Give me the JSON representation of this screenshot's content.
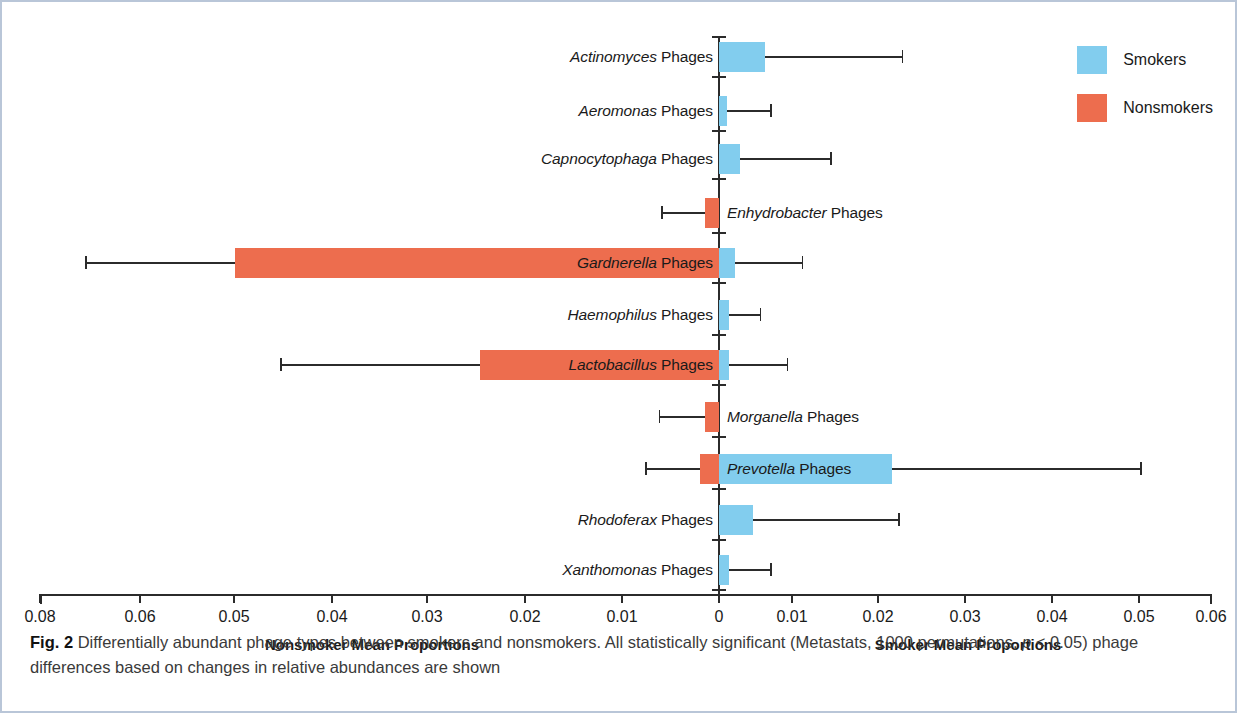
{
  "figure": {
    "caption_label": "Fig. 2",
    "caption_text_part1": "Differentially abundant phage types between smokers and nonsmokers. All statistically significant (Metastats, 1000 permutations, ",
    "caption_p_italic": "p",
    "caption_text_part2": " < 0.05) phage differences based on changes in relative abundances are shown"
  },
  "legend": {
    "position": "top-right",
    "items": [
      {
        "label": "Smokers",
        "color": "#82cdee"
      },
      {
        "label": "Nonsmokers",
        "color": "#ed6d4e"
      }
    ]
  },
  "axis": {
    "left_caption": "Nonsmoker Mean Proportions",
    "right_caption": "Smoker Mean Proportions",
    "tick_labels": [
      "0.08",
      "0.06",
      "0.05",
      "0.04",
      "0.03",
      "0.02",
      "0.01",
      "0",
      "0.01",
      "0.02",
      "0.03",
      "0.04",
      "0.05",
      "0.06"
    ],
    "tick_x": [
      38,
      138,
      232,
      330,
      425,
      523,
      620,
      717,
      790,
      876,
      963,
      1050,
      1137,
      1209
    ]
  },
  "chart_data": {
    "type": "bar",
    "orientation": "horizontal",
    "subtype": "diverging-paired-bar-with-error-bars",
    "title": "Differentially abundant phage types between smokers and nonsmokers",
    "xlabel_left": "Nonsmoker Mean Proportions",
    "xlabel_right": "Smoker Mean Proportions",
    "ylabel": "",
    "grid": false,
    "legend_position": "top-right",
    "xlim_left": 0.08,
    "xlim_right": 0.06,
    "xticks_left": [
      0.08,
      0.06,
      0.05,
      0.04,
      0.03,
      0.02,
      0.01,
      0
    ],
    "xticks_right": [
      0,
      0.01,
      0.02,
      0.03,
      0.04,
      0.05,
      0.06
    ],
    "series": [
      {
        "name": "Smokers",
        "color": "#82cdee",
        "side": "right"
      },
      {
        "name": "Nonsmokers",
        "color": "#ed6d4e",
        "side": "left"
      }
    ],
    "categories": [
      "Actinomyces Phages",
      "Aeromonas Phages",
      "Capnocytophaga Phages",
      "Enhydrobacter Phages",
      "Gardnerella Phages",
      "Haemophilus Phages",
      "Lactobacillus Phages",
      "Morganella Phages",
      "Prevotella Phages",
      "Rhodoferax Phages",
      "Xanthomonas Phages"
    ],
    "rows": [
      {
        "genus": "Actinomyces",
        "suffix": " Phages",
        "label_side": "left",
        "smoker_mean": 0.0053,
        "smoker_err_high": 0.021,
        "nonsmoker_mean": 0.0,
        "nonsmoker_err_high": 0.0,
        "y": 40
      },
      {
        "genus": "Aeromonas",
        "suffix": " Phages",
        "label_side": "left",
        "smoker_mean": 0.0009,
        "smoker_err_high": 0.0059,
        "nonsmoker_mean": 0.0,
        "nonsmoker_err_high": 0.0,
        "y": 94
      },
      {
        "genus": "Capnocytophaga",
        "suffix": " Phages",
        "label_side": "left",
        "smoker_mean": 0.0024,
        "smoker_err_high": 0.0128,
        "nonsmoker_mean": 0.0,
        "nonsmoker_err_high": 0.0,
        "y": 142
      },
      {
        "genus": "Enhydrobacter",
        "suffix": " Phages",
        "label_side": "right",
        "smoker_mean": 0.0,
        "smoker_err_high": 0.0,
        "nonsmoker_mean": 0.0015,
        "nonsmoker_err_high": 0.006,
        "y": 196
      },
      {
        "genus": "Gardnerella",
        "suffix": " Phages",
        "label_side": "inside-left",
        "smoker_mean": 0.0018,
        "smoker_err_high": 0.0095,
        "nonsmoker_mean": 0.0504,
        "nonsmoker_err_high": 0.066,
        "y": 246
      },
      {
        "genus": "Haemophilus",
        "suffix": " Phages",
        "label_side": "left",
        "smoker_mean": 0.0011,
        "smoker_err_high": 0.0047,
        "nonsmoker_mean": 0.0,
        "nonsmoker_err_high": 0.0,
        "y": 298
      },
      {
        "genus": "Lactobacillus",
        "suffix": " Phages",
        "label_side": "inside-left",
        "smoker_mean": 0.0011,
        "smoker_err_high": 0.0078,
        "nonsmoker_mean": 0.0249,
        "nonsmoker_err_high": 0.0457,
        "y": 348
      },
      {
        "genus": "Morganella",
        "suffix": " Phages",
        "label_side": "right",
        "smoker_mean": 0.0,
        "smoker_err_high": 0.0,
        "nonsmoker_mean": 0.0015,
        "nonsmoker_err_high": 0.0063,
        "y": 400
      },
      {
        "genus": "Prevotella",
        "suffix": " Phages",
        "label_side": "inside-right",
        "smoker_mean": 0.0199,
        "smoker_err_high": 0.0484,
        "nonsmoker_mean": 0.002,
        "nonsmoker_err_high": 0.0077,
        "y": 452
      },
      {
        "genus": "Rhodoferax",
        "suffix": " Phages",
        "label_side": "left",
        "smoker_mean": 0.0039,
        "smoker_err_high": 0.0206,
        "nonsmoker_mean": 0.0,
        "nonsmoker_err_high": 0.0,
        "y": 503
      },
      {
        "genus": "Xanthomonas",
        "suffix": " Phages",
        "label_side": "left",
        "smoker_mean": 0.0011,
        "smoker_err_high": 0.0059,
        "nonsmoker_mean": 0.0,
        "nonsmoker_err_high": 0.0,
        "y": 553
      }
    ]
  }
}
